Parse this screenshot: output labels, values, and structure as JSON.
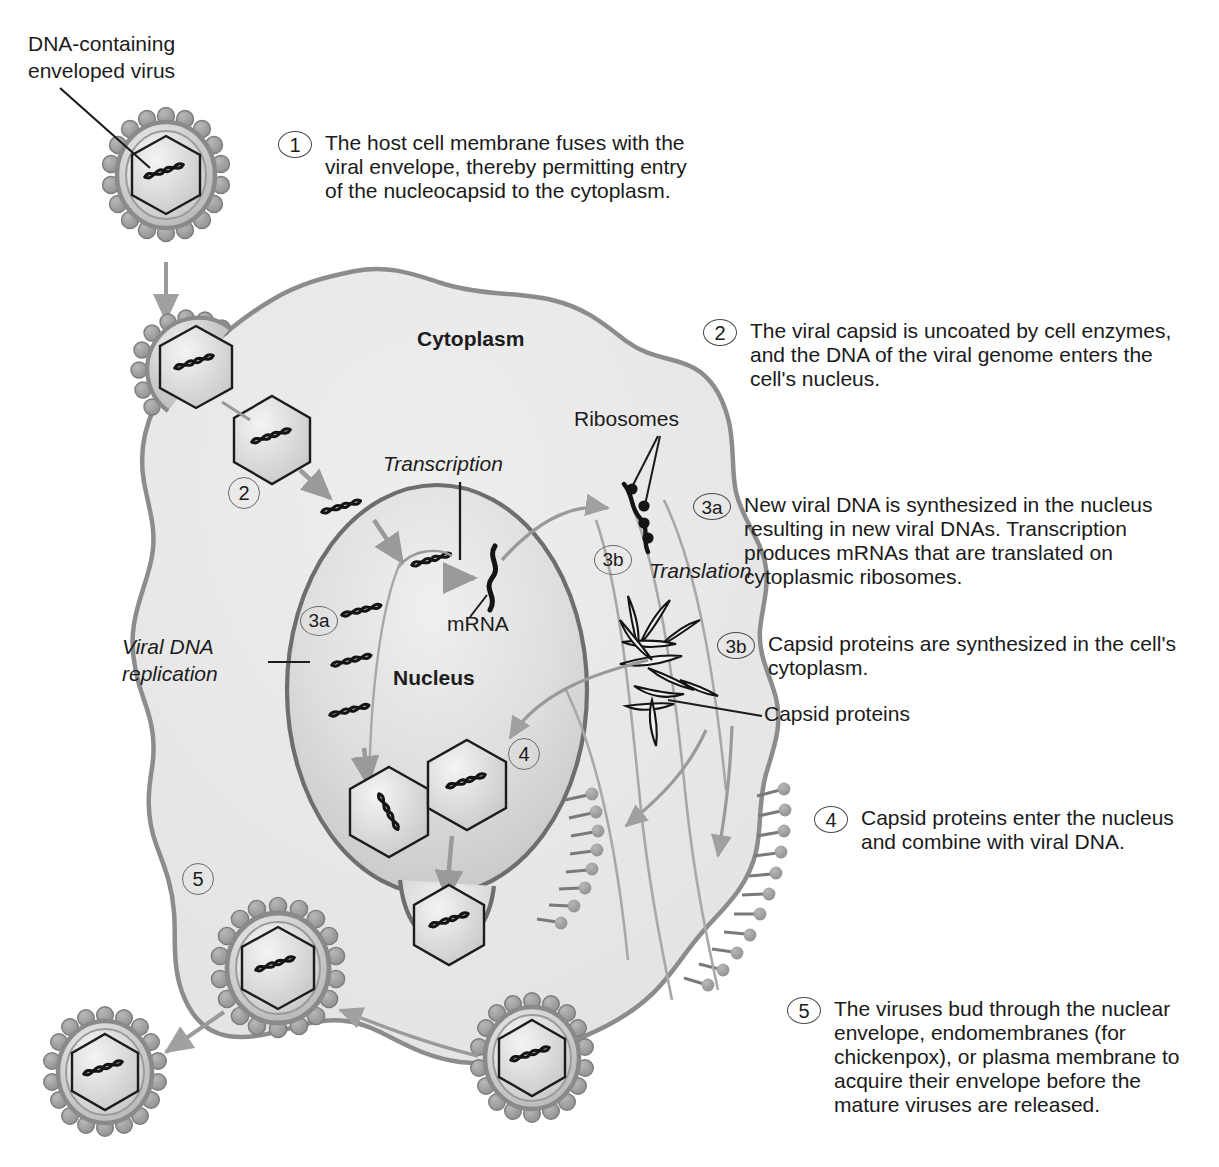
{
  "colors": {
    "cytoplasm_fill": "#e9e9e9",
    "cytoplasm_stroke": "#8c8c8c",
    "nucleus_fill": "#d9d9d9",
    "nucleus_stroke": "#6e6e6e",
    "arrow_gray": "#9a9a9a",
    "ink": "#1c1c1c",
    "spike_fill": "#9c9c9c",
    "envelope_fill": "#c9c9c9"
  },
  "labels": {
    "virus_caption": "DNA-containing\nenveloped virus",
    "cytoplasm": "Cytoplasm",
    "nucleus": "Nucleus",
    "ribosomes": "Ribosomes",
    "transcription": "Transcription",
    "translation": "Translation",
    "mrna": "mRNA",
    "viral_dna_replication": "Viral DNA\nreplication",
    "capsid_proteins": "Capsid proteins"
  },
  "inline_markers": [
    {
      "id": "marker-2",
      "text": "2"
    },
    {
      "id": "marker-3a",
      "text": "3a"
    },
    {
      "id": "marker-3b",
      "text": "3b"
    },
    {
      "id": "marker-4",
      "text": "4"
    },
    {
      "id": "marker-5",
      "text": "5"
    }
  ],
  "steps": [
    {
      "number": "1",
      "text": "The host cell membrane fuses\nwith the viral envelope, thereby\npermitting entry of the nucleocapsid\nto the cytoplasm."
    },
    {
      "number": "2",
      "text": "The viral capsid is uncoated by cell\nenzymes, and the DNA of the viral\ngenome enters the cell's nucleus."
    },
    {
      "number": "3a",
      "text": "New viral DNA is synthesized in the\nnucleus resulting in new viral DNAs.\nTranscription produces mRNAs that\nare translated on cytoplasmic\nribosomes."
    },
    {
      "number": "3b",
      "text": "Capsid proteins are synthesized\nin the cell's cytoplasm."
    },
    {
      "number": "4",
      "text": "Capsid proteins enter the nucleus\nand combine with viral DNA."
    },
    {
      "number": "5",
      "text": "The viruses bud through the nuclear\nenvelope, endomembranes (for\nchickenpox), or plasma membrane to\nacquire their envelope before the\nmature viruses are released."
    }
  ]
}
